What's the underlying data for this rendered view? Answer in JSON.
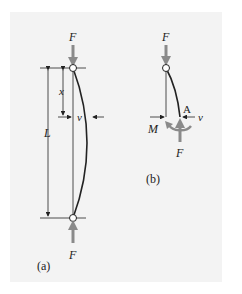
{
  "figure": {
    "background": "#f3f3f3",
    "force_color": "#8a8a8a",
    "line_color": "#222222",
    "panel_a": {
      "caption": "(a)",
      "labels": {
        "force_top": "F",
        "force_bottom": "F",
        "length": "L",
        "position": "x",
        "deflection": "v"
      }
    },
    "panel_b": {
      "caption": "(b)",
      "labels": {
        "force_top": "F",
        "force_bottom": "F",
        "moment": "M",
        "point": "A",
        "deflection": "v"
      }
    }
  }
}
